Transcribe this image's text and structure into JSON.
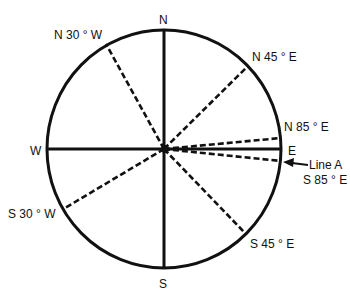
{
  "diagram": {
    "type": "compass-bearings",
    "cardinals": {
      "north": "N",
      "south": "S",
      "east": "E",
      "west": "W"
    },
    "bearings": [
      {
        "label": "N 30 ° W",
        "azimuth_deg": 330
      },
      {
        "label": "N 45 ° E",
        "azimuth_deg": 45
      },
      {
        "label": "N 85 ° E",
        "azimuth_deg": 85
      },
      {
        "label": "S 85 ° E",
        "azimuth_deg": 95
      },
      {
        "label": "S 45 ° E",
        "azimuth_deg": 135
      },
      {
        "label": "S 30 ° W",
        "azimuth_deg": 210
      }
    ],
    "callout": {
      "label": "Line A",
      "bearing": "S 85 ° E"
    }
  }
}
